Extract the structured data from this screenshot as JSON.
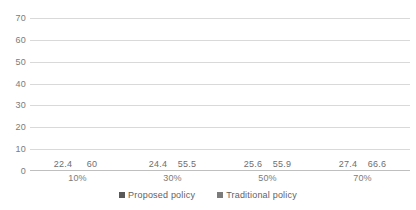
{
  "chart_data": {
    "type": "bar",
    "title": "",
    "subtitle": "",
    "xlabel": "",
    "ylabel": "",
    "categories": [
      "10%",
      "30%",
      "50%",
      "70%"
    ],
    "series": [
      {
        "name": "Proposed policy",
        "color": "#595959",
        "values": [
          22.4,
          24.4,
          25.6,
          27.4
        ],
        "labels": [
          "22.4",
          "24.4",
          "25.6",
          "27.4"
        ]
      },
      {
        "name": "Traditional policy",
        "color": "#7b7b7b",
        "values": [
          60,
          55.5,
          55.9,
          66.6
        ],
        "labels": [
          "60",
          "55.5",
          "55.9",
          "66.6"
        ]
      }
    ],
    "ylim": [
      0,
      70
    ],
    "ytick_step": 10,
    "ytick_labels": [
      "70",
      "60",
      "50",
      "40",
      "30",
      "20",
      "10",
      "0"
    ],
    "grid": true,
    "grid_color": "#d9d9d9",
    "legend_position": "bottom",
    "data_labels_shown": true
  },
  "legend": {
    "items": [
      {
        "label": "Proposed policy"
      },
      {
        "label": "Traditional policy"
      }
    ]
  }
}
